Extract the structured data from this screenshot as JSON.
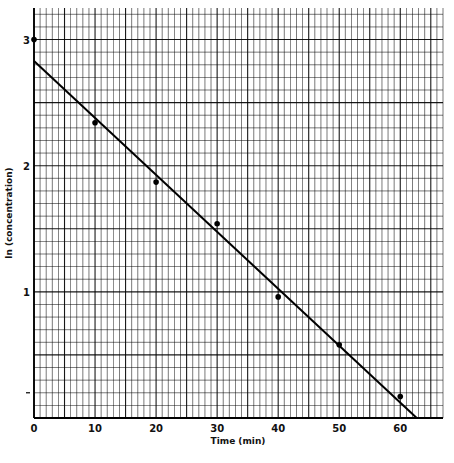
{
  "chart_data": {
    "type": "scatter",
    "title": "",
    "xlabel": "Time (min)",
    "ylabel": "ln (concentration)",
    "xlim": [
      0,
      67
    ],
    "ylim": [
      0,
      3.25
    ],
    "grid": true,
    "x_ticks": [
      "0",
      "10",
      "20",
      "30",
      "40",
      "50",
      "60"
    ],
    "y_ticks": [
      "0",
      "1",
      "2",
      "3"
    ],
    "y_minor_tick_marks": [
      0.2
    ],
    "series": [
      {
        "name": "data",
        "kind": "points",
        "x": [
          0,
          10,
          20,
          30,
          40,
          50,
          60
        ],
        "y": [
          3.0,
          2.34,
          1.87,
          1.54,
          0.96,
          0.58,
          0.17
        ]
      },
      {
        "name": "fit",
        "kind": "line",
        "x": [
          0,
          62.7
        ],
        "y": [
          2.83,
          0.0
        ]
      }
    ]
  },
  "labels": {
    "xlabel": "Time (min)",
    "ylabel": "ln (concentration)"
  }
}
